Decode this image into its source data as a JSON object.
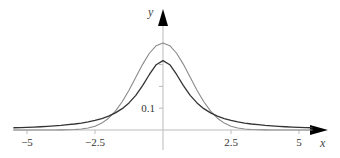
{
  "chart_data": {
    "type": "line",
    "title": "",
    "xlabel": "x",
    "ylabel": "y",
    "xlim": [
      -5.5,
      6
    ],
    "ylim": [
      0,
      0.55
    ],
    "grid": false,
    "legend": null,
    "x_ticks": [
      {
        "value": -5,
        "label": "−5"
      },
      {
        "value": -2.5,
        "label": "−2.5"
      },
      {
        "value": 2.5,
        "label": "2.5"
      },
      {
        "value": 5,
        "label": "5"
      }
    ],
    "y_ticks": [
      {
        "value": 0.1,
        "label": "0.1"
      },
      {
        "value": 0.2,
        "label": ""
      },
      {
        "value": 0.3,
        "label": ""
      }
    ],
    "x": [
      -5.5,
      -5.25,
      -5,
      -4.75,
      -4.5,
      -4.25,
      -4,
      -3.75,
      -3.5,
      -3.25,
      -3,
      -2.75,
      -2.5,
      -2.25,
      -2,
      -1.75,
      -1.5,
      -1.25,
      -1,
      -0.75,
      -0.5,
      -0.25,
      0,
      0.25,
      0.5,
      0.75,
      1,
      1.25,
      1.5,
      1.75,
      2,
      2.25,
      2.5,
      2.75,
      3,
      3.25,
      3.5,
      3.75,
      4,
      4.25,
      4.5,
      4.75,
      5,
      5.25,
      5.5
    ],
    "series": [
      {
        "name": "Normal (standard)",
        "color": "#8a8a8a",
        "width": 1.1,
        "values": [
          0.0,
          0.0,
          0.0,
          0.0,
          2e-05,
          5e-05,
          0.00013,
          0.00035,
          0.00087,
          0.00203,
          0.00443,
          0.00909,
          0.01753,
          0.03174,
          0.05399,
          0.08628,
          0.12952,
          0.18265,
          0.24197,
          0.30114,
          0.35207,
          0.38667,
          0.39894,
          0.38667,
          0.35207,
          0.30114,
          0.24197,
          0.18265,
          0.12952,
          0.08628,
          0.05399,
          0.03174,
          0.01753,
          0.00909,
          0.00443,
          0.00203,
          0.00087,
          0.00035,
          0.00013,
          5e-05,
          2e-05,
          0.0,
          0.0,
          0.0,
          0.0
        ]
      },
      {
        "name": "Cauchy (standard)",
        "color": "#333333",
        "width": 1.3,
        "values": [
          0.01021,
          0.01105,
          0.01224,
          0.01348,
          0.01491,
          0.01673,
          0.01872,
          0.02118,
          0.02448,
          0.02747,
          0.03183,
          0.03711,
          0.0439,
          0.05256,
          0.06366,
          0.07842,
          0.09794,
          0.1242,
          0.15915,
          0.20372,
          0.25465,
          0.29958,
          0.31831,
          0.29958,
          0.25465,
          0.20372,
          0.15915,
          0.1242,
          0.09794,
          0.07842,
          0.06366,
          0.05256,
          0.0439,
          0.03711,
          0.03183,
          0.02747,
          0.02448,
          0.02118,
          0.01872,
          0.01673,
          0.01491,
          0.01348,
          0.01224,
          0.01105,
          0.01021
        ]
      }
    ],
    "axis_color": "#bbbbbb",
    "arrow_color": "#000000"
  }
}
